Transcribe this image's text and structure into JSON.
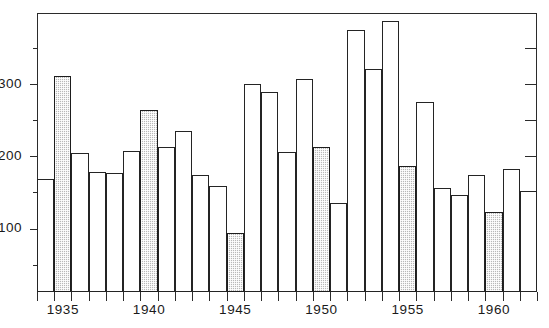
{
  "chart_data": {
    "type": "bar",
    "title": "",
    "subtitle": "",
    "xlabel": "",
    "ylabel": "",
    "categories": [
      "1934",
      "1935",
      "1936",
      "1937",
      "1938",
      "1939",
      "1940",
      "1941",
      "1942",
      "1943",
      "1944",
      "1945",
      "1946",
      "1947",
      "1948",
      "1949",
      "1950",
      "1951",
      "1952",
      "1953",
      "1954",
      "1955",
      "1956",
      "1957",
      "1958",
      "1959",
      "1960",
      "1961",
      "1962"
    ],
    "values": [
      170,
      313,
      206,
      180,
      178,
      208,
      266,
      214,
      236,
      175,
      160,
      95,
      302,
      291,
      207,
      309,
      214,
      137,
      376,
      322,
      389,
      188,
      277,
      157,
      148,
      176,
      124,
      183,
      153
    ],
    "bar_styles": [
      "open",
      "shaded",
      "open",
      "open",
      "open",
      "open",
      "shaded",
      "open",
      "open",
      "open",
      "open",
      "shaded",
      "open",
      "open",
      "open",
      "open",
      "shaded",
      "open",
      "open",
      "open",
      "open",
      "shaded",
      "open",
      "open",
      "open",
      "open",
      "shaded",
      "open",
      "open"
    ],
    "ylim": [
      13,
      400
    ],
    "xlim": [
      1933.5,
      1962.5
    ],
    "ytick_values": [
      50,
      100,
      150,
      200,
      250,
      300,
      350
    ],
    "ytick_labels": [
      "",
      "100",
      "",
      "200",
      "",
      "300",
      ""
    ],
    "ylabels_shown": [
      {
        "value": 300,
        "text": "300"
      },
      {
        "value": 200,
        "text": "200"
      },
      {
        "value": 100,
        "text": "100"
      }
    ],
    "xtick_labels": [
      {
        "year": 1935,
        "text": "1935"
      },
      {
        "year": 1940,
        "text": "1940"
      },
      {
        "year": 1945,
        "text": "1945"
      },
      {
        "year": 1950,
        "text": "1950"
      },
      {
        "year": 1955,
        "text": "1955"
      },
      {
        "year": 1960,
        "text": "1960"
      }
    ],
    "grid": false,
    "legend": null,
    "legend_position": "none",
    "colors": {
      "axis": "#2b2b2b",
      "bar_outline": "#242424",
      "bar_open_fill": "#ffffff",
      "bar_shaded_fill": "#b9b9b9",
      "background": "#ffffff"
    }
  }
}
